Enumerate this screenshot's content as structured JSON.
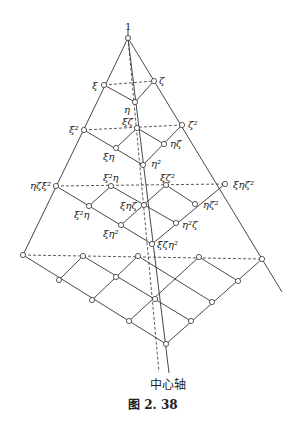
{
  "diagram": {
    "top_label": "1",
    "axis_label": "中心轴",
    "caption": "图 2. 38",
    "nodes": [
      {
        "id": "apex",
        "x": 128,
        "y": 38,
        "label": "1"
      },
      {
        "id": "xi",
        "x": 104,
        "y": 85,
        "label": "ξ"
      },
      {
        "id": "zeta",
        "x": 154,
        "y": 81,
        "label": "ζ"
      },
      {
        "id": "eta",
        "x": 135,
        "y": 102,
        "label": "η"
      },
      {
        "id": "xi2",
        "x": 84,
        "y": 130,
        "label": "ξ²"
      },
      {
        "id": "xizeta",
        "x": 137,
        "y": 128,
        "label": "ξζ"
      },
      {
        "id": "zeta2",
        "x": 182,
        "y": 125,
        "label": "ζ²"
      },
      {
        "id": "xieta",
        "x": 116,
        "y": 148,
        "label": "ξη"
      },
      {
        "id": "etazeta",
        "x": 164,
        "y": 144,
        "label": "ηζ"
      },
      {
        "id": "eta2",
        "x": 143,
        "y": 165,
        "label": "η²"
      },
      {
        "id": "etazetaxi2",
        "x": 56,
        "y": 186,
        "label": "ηζξ²"
      },
      {
        "id": "xi2eta_top",
        "x": 111,
        "y": 186,
        "label": "ξ²η"
      },
      {
        "id": "xizeta2",
        "x": 166,
        "y": 185,
        "label": "ξζ²"
      },
      {
        "id": "xietazeta2",
        "x": 225,
        "y": 184,
        "label": "ξηζ²"
      },
      {
        "id": "xi2eta",
        "x": 89,
        "y": 206,
        "label": "ξ²η"
      },
      {
        "id": "xietazeta",
        "x": 144,
        "y": 205,
        "label": "ξηζ"
      },
      {
        "id": "etazeta2",
        "x": 195,
        "y": 204,
        "label": "ηζ²"
      },
      {
        "id": "xieta2",
        "x": 121,
        "y": 225,
        "label": "ξη²"
      },
      {
        "id": "eta2zeta",
        "x": 176,
        "y": 223,
        "label": "η²ζ"
      },
      {
        "id": "xizetaeta2",
        "x": 152,
        "y": 244,
        "label": "ξζη²"
      },
      {
        "id": "r4a",
        "x": 23,
        "y": 255,
        "label": ""
      },
      {
        "id": "r4b",
        "x": 83,
        "y": 256,
        "label": ""
      },
      {
        "id": "r4c",
        "x": 138,
        "y": 256,
        "label": ""
      },
      {
        "id": "r4d",
        "x": 199,
        "y": 257,
        "label": ""
      },
      {
        "id": "r4e",
        "x": 262,
        "y": 259,
        "label": ""
      },
      {
        "id": "r5a",
        "x": 59,
        "y": 280,
        "label": ""
      },
      {
        "id": "r5b",
        "x": 116,
        "y": 277,
        "label": ""
      },
      {
        "id": "r5c",
        "x": 238,
        "y": 281,
        "label": ""
      },
      {
        "id": "r6a",
        "x": 92,
        "y": 300,
        "label": ""
      },
      {
        "id": "r6b",
        "x": 155,
        "y": 299,
        "label": ""
      },
      {
        "id": "r6c",
        "x": 212,
        "y": 302,
        "label": ""
      },
      {
        "id": "r7a",
        "x": 129,
        "y": 321,
        "label": ""
      },
      {
        "id": "r7b",
        "x": 191,
        "y": 321,
        "label": ""
      },
      {
        "id": "bottom",
        "x": 166,
        "y": 344,
        "label": ""
      }
    ]
  }
}
